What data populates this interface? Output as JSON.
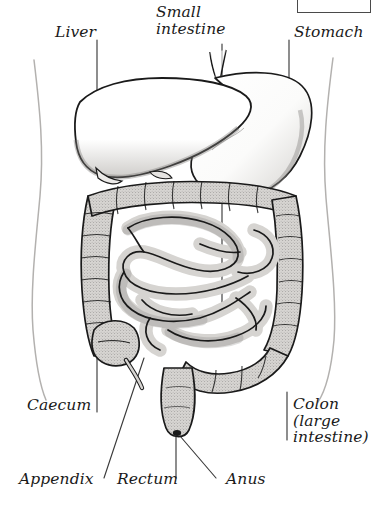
{
  "figure": {
    "background_color": "#ffffff",
    "line_color": "#1a1a1a",
    "organ_fill": "#d6d4d1",
    "body_outline_color": "#b0aeac",
    "label_color": "#1a1a1a"
  },
  "labels": {
    "liver": "Liver",
    "small_intestine": "Small\nintestine",
    "stomach": "Stomach",
    "caecum": "Caecum",
    "colon": "Colon\n(large\nintestine)",
    "appendix": "Appendix",
    "rectum": "Rectum",
    "anus": "Anus"
  },
  "organs": [
    {
      "name": "liver",
      "label": "Liver",
      "region": "upper-left"
    },
    {
      "name": "stomach",
      "label": "Stomach",
      "region": "upper-right"
    },
    {
      "name": "small-intestine",
      "label": "Small intestine",
      "region": "centre"
    },
    {
      "name": "colon",
      "label": "Colon (large intestine)",
      "region": "perimeter"
    },
    {
      "name": "caecum",
      "label": "Caecum",
      "region": "lower-left"
    },
    {
      "name": "appendix",
      "label": "Appendix",
      "region": "lower-left"
    },
    {
      "name": "rectum",
      "label": "Rectum",
      "region": "lower-centre"
    },
    {
      "name": "anus",
      "label": "Anus",
      "region": "lower-centre"
    }
  ]
}
